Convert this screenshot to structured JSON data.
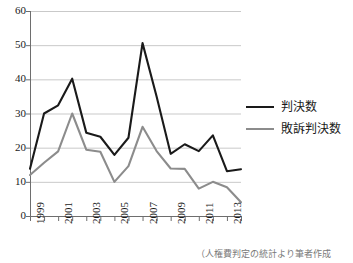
{
  "chart_data": {
    "type": "line",
    "title": "",
    "xlabel": "",
    "ylabel": "",
    "x": [
      1999,
      2000,
      2001,
      2002,
      2003,
      2004,
      2005,
      2006,
      2007,
      2008,
      2009,
      2010,
      2011,
      2012,
      2013,
      2014
    ],
    "categories": [
      "1999",
      "2000",
      "2001",
      "2002",
      "2003",
      "2004",
      "2005",
      "2006",
      "2007",
      "2008",
      "2009",
      "2010",
      "2011",
      "2012",
      "2013",
      "2014"
    ],
    "xtick_labels": [
      "1999",
      "2001",
      "2003",
      "2005",
      "2007",
      "2009",
      "2011",
      "2013"
    ],
    "xtick_values": [
      1999,
      2001,
      2003,
      2005,
      2007,
      2009,
      2011,
      2013
    ],
    "ytick_labels": [
      "0",
      "10",
      "20",
      "30",
      "40",
      "50",
      "60"
    ],
    "ytick_values": [
      0,
      10,
      20,
      30,
      40,
      50,
      60
    ],
    "ylim": [
      0,
      60
    ],
    "xlim": [
      1999,
      2014
    ],
    "grid": "horizontal",
    "legend_position": "right",
    "series": [
      {
        "name": "判決数",
        "color": "#1a1a1a",
        "linewidth": 2.1,
        "values": [
          13.8,
          30.0,
          32.4,
          40.2,
          24.4,
          23.2,
          17.9,
          22.9,
          50.6,
          35.0,
          18.2,
          21.0,
          19.0,
          23.6,
          13.1,
          13.7
        ]
      },
      {
        "name": "敗訴判決数",
        "color": "#8c8c8c",
        "linewidth": 2.1,
        "values": [
          12.0,
          15.6,
          18.9,
          30.0,
          19.4,
          18.8,
          10.0,
          14.6,
          26.1,
          19.0,
          13.9,
          13.8,
          8.0,
          10.0,
          8.4,
          4.0
        ]
      }
    ]
  },
  "legend": {
    "items": [
      {
        "label": "判決数",
        "color": "#1a1a1a"
      },
      {
        "label": "敗訴判決数",
        "color": "#8c8c8c"
      }
    ]
  },
  "caption": {
    "text": "（人権費判定の統計より筆者作成"
  },
  "colors": {
    "series_primary": "#1a1a1a",
    "series_secondary": "#8c8c8c",
    "gridline": "#c9c9c9",
    "axis": "#6e6e6e",
    "background": "#ffffff"
  }
}
